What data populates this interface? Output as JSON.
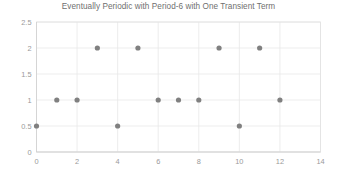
{
  "chart_data": {
    "type": "scatter",
    "title": "Eventually Periodic with Period-6 with One Transient Term",
    "xlabel": "",
    "ylabel": "",
    "x": [
      0,
      1,
      2,
      3,
      4,
      5,
      6,
      7,
      8,
      9,
      10,
      11,
      12
    ],
    "values": [
      0.5,
      1,
      1,
      2,
      0.5,
      2,
      1,
      1,
      1,
      2,
      0.5,
      2,
      1
    ],
    "series": [
      {
        "name": "sequence",
        "points": [
          {
            "x": 0,
            "y": 0.5
          },
          {
            "x": 1,
            "y": 1
          },
          {
            "x": 2,
            "y": 1
          },
          {
            "x": 3,
            "y": 2
          },
          {
            "x": 4,
            "y": 0.5
          },
          {
            "x": 5,
            "y": 2
          },
          {
            "x": 6,
            "y": 1
          },
          {
            "x": 7,
            "y": 1
          },
          {
            "x": 8,
            "y": 1
          },
          {
            "x": 9,
            "y": 2
          },
          {
            "x": 10,
            "y": 0.5
          },
          {
            "x": 11,
            "y": 2
          },
          {
            "x": 12,
            "y": 1
          }
        ]
      }
    ],
    "xlim": [
      0,
      14
    ],
    "ylim": [
      0,
      2.5
    ],
    "xticks": [
      0,
      2,
      4,
      6,
      8,
      10,
      12,
      14
    ],
    "xtick_labels": [
      "0",
      "2",
      "4",
      "6",
      "8",
      "10",
      "12",
      "14"
    ],
    "yticks": [
      0,
      0.5,
      1,
      1.5,
      2,
      2.5
    ],
    "ytick_labels": [
      "0",
      "0.5",
      "1",
      "1.5",
      "2",
      "2.5"
    ],
    "grid": true,
    "grid_axis": "both",
    "legend": false,
    "marker": "circle",
    "marker_color": "#808080",
    "grid_color": "#e8e8e8",
    "axis_color": "#d2d2d2",
    "title_color": "#6f6f6f",
    "tick_color": "#9a9a9a",
    "background": "#ffffff"
  }
}
